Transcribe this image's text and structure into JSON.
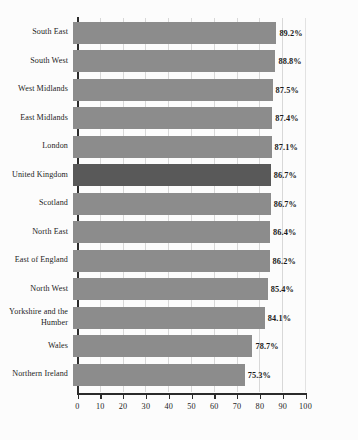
{
  "chart_data": {
    "type": "bar",
    "orientation": "horizontal",
    "title": "",
    "xlabel": "",
    "ylabel": "",
    "xlim": [
      0,
      100
    ],
    "xticks": [
      0,
      10,
      20,
      30,
      40,
      50,
      60,
      70,
      80,
      90,
      100
    ],
    "grid": "vertical",
    "legend": "none",
    "value_suffix": "%",
    "categories": [
      "South East",
      "South West",
      "West Midlands",
      "East Midlands",
      "London",
      "United Kingdom",
      "Scotland",
      "North East",
      "East of England",
      "North West",
      "Yorkshire and the Humber",
      "Wales",
      "Northern Ireland"
    ],
    "values": [
      89.2,
      88.8,
      87.5,
      87.4,
      87.1,
      86.7,
      86.7,
      86.4,
      86.2,
      85.4,
      84.1,
      78.7,
      75.3
    ],
    "value_labels": [
      "89.2%",
      "88.8%",
      "87.5%",
      "87.4%",
      "87.1%",
      "86.7%",
      "86.7%",
      "86.4%",
      "86.2%",
      "85.4%",
      "84.1%",
      "78.7%",
      "75.3%"
    ],
    "highlight_category": "United Kingdom",
    "colors": {
      "bar": "#8c8c8c",
      "bar_highlight": "#595959",
      "axis": "#2b2b2b",
      "gridline": "#d8d8d8",
      "background": "#fcfcfc",
      "text": "#1a1a1a"
    }
  }
}
